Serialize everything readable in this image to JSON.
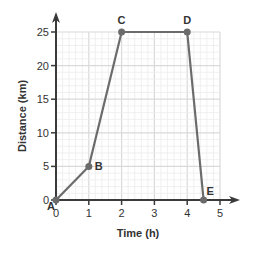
{
  "chart_data": {
    "type": "line",
    "title": "",
    "xlabel": "Time (h)",
    "ylabel": "Distance (km)",
    "xlim": [
      0,
      5
    ],
    "ylim": [
      0,
      25
    ],
    "x_ticks": [
      0,
      1,
      2,
      3,
      4,
      5
    ],
    "y_ticks": [
      0,
      5,
      10,
      15,
      20,
      25
    ],
    "grid": true,
    "points": [
      {
        "label": "A",
        "x": 0,
        "y": 0
      },
      {
        "label": "B",
        "x": 1,
        "y": 5
      },
      {
        "label": "C",
        "x": 2,
        "y": 25
      },
      {
        "label": "D",
        "x": 4,
        "y": 25
      },
      {
        "label": "E",
        "x": 4.5,
        "y": 0
      }
    ],
    "series": [
      {
        "name": "Distance",
        "x": [
          0,
          1,
          2,
          4,
          4.5
        ],
        "values": [
          0,
          5,
          25,
          25,
          0
        ]
      }
    ]
  },
  "colors": {
    "line": "#6b6b6b",
    "axis": "#3a3a3a",
    "grid_major": "#d9d9d9",
    "grid_minor": "#ececec",
    "text": "#333333"
  }
}
